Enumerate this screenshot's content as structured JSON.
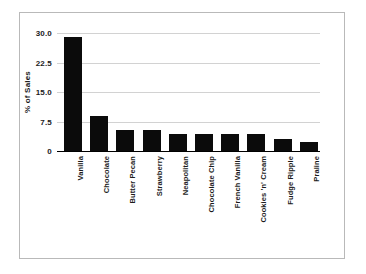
{
  "chart_data": {
    "type": "bar",
    "title": "",
    "xlabel": "",
    "ylabel": "% of Sales",
    "categories": [
      "Vanilla",
      "Chocolate",
      "Butter Pecan",
      "Strawberry",
      "Neapolitan",
      "Chocolate Chip",
      "French Vanilla",
      "Cookies 'n' Cream",
      "Fudge Ripple",
      "Praline"
    ],
    "values": [
      29.0,
      8.8,
      5.3,
      5.3,
      4.2,
      4.2,
      4.2,
      4.2,
      3.0,
      2.2
    ],
    "ylim": [
      0,
      30
    ],
    "yticks": [
      0,
      7.5,
      15.0,
      22.5,
      30.0
    ],
    "ytick_labels": [
      "0",
      "7.5",
      "15.0",
      "22.5",
      "30.0"
    ],
    "grid": true,
    "legend": false,
    "bar_color": "#0b0b0b",
    "gridline_color": "#d2d2d2",
    "axis_color": "#000000",
    "background_color": "#ffffff",
    "frame_color": "#b9b9b9"
  }
}
